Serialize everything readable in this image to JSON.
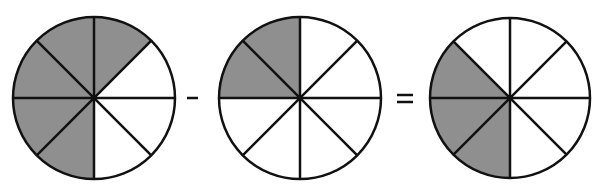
{
  "diagram": {
    "equation": "5/8 - 2/8 = 3/8",
    "colors": {
      "shaded": "#8f8f8f",
      "unshaded": "#ffffff",
      "stroke": "#111111"
    },
    "circles": [
      {
        "id": "minuend",
        "cx": 94,
        "cy": 98,
        "r": 81,
        "segments": 8,
        "shaded": [
          0,
          5,
          6,
          7,
          4
        ],
        "fraction": "5/8"
      },
      {
        "id": "subtrahend",
        "cx": 300,
        "cy": 98,
        "r": 81,
        "segments": 8,
        "shaded": [
          6,
          7
        ],
        "fraction": "2/8"
      },
      {
        "id": "difference",
        "cx": 510,
        "cy": 98,
        "r": 80,
        "segments": 8,
        "shaded": [
          4,
          5,
          6
        ],
        "fraction": "3/8"
      }
    ],
    "operators": [
      {
        "id": "minus",
        "symbol": "−",
        "x1": 187,
        "x2": 198,
        "y": 98
      },
      {
        "id": "equals",
        "symbol": "=",
        "x1": 397,
        "x2": 413,
        "y1": 95,
        "y2": 102
      }
    ]
  }
}
